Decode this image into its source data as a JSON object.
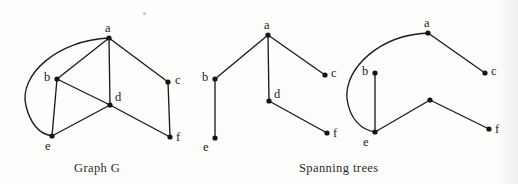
{
  "figure": {
    "width": 518,
    "height": 184,
    "background_color": "#fdfdfc",
    "ink_color": "#1b1b1b"
  },
  "captions": [
    {
      "id": "caption-graph-g",
      "text": "Graph G",
      "x": 74,
      "y": 161
    },
    {
      "id": "caption-spanning-trees",
      "text": "Spanning trees",
      "x": 299,
      "y": 161
    }
  ],
  "panels": [
    {
      "id": "graph-g",
      "title": "Graph G",
      "vertices": [
        {
          "id": "a",
          "label": "a",
          "x": 109,
          "y": 38,
          "label_x": 105,
          "label_y": 22
        },
        {
          "id": "b",
          "label": "b",
          "x": 57,
          "y": 79,
          "label_x": 44,
          "label_y": 71
        },
        {
          "id": "c",
          "label": "c",
          "x": 168,
          "y": 82,
          "label_x": 175,
          "label_y": 74
        },
        {
          "id": "d",
          "label": "d",
          "x": 110,
          "y": 105,
          "label_x": 115,
          "label_y": 91
        },
        {
          "id": "e",
          "label": "e",
          "x": 52,
          "y": 136,
          "label_x": 45,
          "label_y": 140
        },
        {
          "id": "f",
          "label": "f",
          "x": 170,
          "y": 137,
          "label_x": 176,
          "label_y": 131
        }
      ],
      "edges": [
        {
          "from": "a",
          "to": "b",
          "type": "straight"
        },
        {
          "from": "a",
          "to": "c",
          "type": "straight"
        },
        {
          "from": "a",
          "to": "d",
          "type": "straight"
        },
        {
          "from": "a",
          "to": "e",
          "type": "curved",
          "path": "M 109 38 C 58 40, 18 75, 26 106 C 31 126, 40 134, 52 136"
        },
        {
          "from": "b",
          "to": "d",
          "type": "straight"
        },
        {
          "from": "b",
          "to": "e",
          "type": "straight"
        },
        {
          "from": "c",
          "to": "f",
          "type": "straight"
        },
        {
          "from": "d",
          "to": "e",
          "type": "straight"
        },
        {
          "from": "d",
          "to": "f",
          "type": "straight"
        }
      ]
    },
    {
      "id": "spanning-tree-1",
      "title": "Spanning tree 1",
      "vertices": [
        {
          "id": "a",
          "label": "a",
          "x": 268,
          "y": 35,
          "label_x": 264,
          "label_y": 19
        },
        {
          "id": "b",
          "label": "b",
          "x": 215,
          "y": 79,
          "label_x": 202,
          "label_y": 71
        },
        {
          "id": "c",
          "label": "c",
          "x": 325,
          "y": 75,
          "label_x": 331,
          "label_y": 67
        },
        {
          "id": "d",
          "label": "d",
          "x": 269,
          "y": 101,
          "label_x": 274,
          "label_y": 88
        },
        {
          "id": "e",
          "label": "e",
          "x": 215,
          "y": 138,
          "label_x": 203,
          "label_y": 141
        },
        {
          "id": "f",
          "label": "f",
          "x": 327,
          "y": 133,
          "label_x": 333,
          "label_y": 127
        }
      ],
      "edges": [
        {
          "from": "a",
          "to": "b",
          "type": "straight"
        },
        {
          "from": "a",
          "to": "c",
          "type": "straight"
        },
        {
          "from": "a",
          "to": "d",
          "type": "straight"
        },
        {
          "from": "b",
          "to": "e",
          "type": "straight"
        },
        {
          "from": "d",
          "to": "f",
          "type": "straight"
        }
      ]
    },
    {
      "id": "spanning-tree-2",
      "title": "Spanning tree 2",
      "vertices": [
        {
          "id": "a",
          "label": "a",
          "x": 428,
          "y": 33,
          "label_x": 424,
          "label_y": 17
        },
        {
          "id": "b",
          "label": "b",
          "x": 375,
          "y": 73,
          "label_x": 362,
          "label_y": 65
        },
        {
          "id": "c",
          "label": "c",
          "x": 485,
          "y": 73,
          "label_x": 491,
          "label_y": 65
        },
        {
          "id": "d",
          "label": "",
          "x": 430,
          "y": 100,
          "label_x": 0,
          "label_y": 0
        },
        {
          "id": "e",
          "label": "e",
          "x": 375,
          "y": 132,
          "label_x": 363,
          "label_y": 136
        },
        {
          "id": "f",
          "label": "f",
          "x": 489,
          "y": 129,
          "label_x": 495,
          "label_y": 123
        }
      ],
      "edges": [
        {
          "from": "a",
          "to": "c",
          "type": "straight"
        },
        {
          "from": "a",
          "to": "e",
          "type": "curved",
          "path": "M 428 33 C 380 35, 344 68, 347 99 C 350 120, 362 130, 375 132"
        },
        {
          "from": "b",
          "to": "e",
          "type": "straight"
        },
        {
          "from": "e",
          "to": "d",
          "type": "straight"
        },
        {
          "from": "d",
          "to": "f",
          "type": "straight"
        }
      ]
    }
  ]
}
